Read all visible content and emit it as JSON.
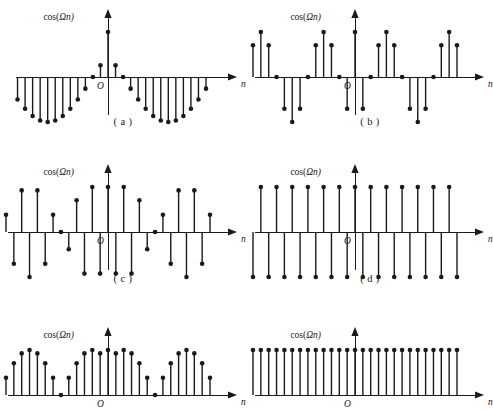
{
  "figure": {
    "kind": "stem-plot-grid",
    "background_color": "#ffffff",
    "ink_color": "#1a1a1a",
    "rows": 3,
    "cols": 2
  },
  "labels": {
    "y_axis_prefix": "cos(",
    "y_axis_symbol": "Ω",
    "y_axis_suffix": "n)",
    "x_axis": "n",
    "origin": "O"
  },
  "captions": {
    "a": "( a )",
    "b": "( b )",
    "c": "( c )",
    "d": "( d )",
    "e": "( e )",
    "f": "( f )"
  },
  "chart_data": [
    {
      "id": "a",
      "type": "scatter",
      "title": "",
      "ylabel": "cos(Ωn)",
      "xlabel": "n",
      "grid": false,
      "legend": null,
      "omega_over_pi": 0.0833,
      "n_min": -13,
      "n_max": 13,
      "ylim": [
        -1,
        1
      ],
      "x": [
        -13,
        -12,
        -11,
        -10,
        -9,
        -8,
        -7,
        -6,
        -5,
        -4,
        -3,
        -2,
        -1,
        0,
        1,
        2,
        3,
        4,
        5,
        6,
        7,
        8,
        9,
        10,
        11,
        12,
        13
      ],
      "values": [
        -0.259,
        -0.5,
        -0.707,
        -0.866,
        -0.966,
        -1.0,
        -0.966,
        -0.866,
        -0.707,
        -0.5,
        -0.259,
        0.0,
        0.259,
        1.0,
        0.259,
        0.0,
        -0.259,
        -0.5,
        -0.707,
        -0.866,
        -0.966,
        -1.0,
        -0.966,
        -0.866,
        -0.707,
        -0.5,
        -0.259
      ]
    },
    {
      "id": "b",
      "type": "scatter",
      "title": "",
      "ylabel": "cos(Ωn)",
      "xlabel": "n",
      "grid": false,
      "legend": null,
      "omega_over_pi": 0.25,
      "n_min": -13,
      "n_max": 13,
      "ylim": [
        -1,
        1
      ],
      "x": [
        -13,
        -12,
        -11,
        -10,
        -9,
        -8,
        -7,
        -6,
        -5,
        -4,
        -3,
        -2,
        -1,
        0,
        1,
        2,
        3,
        4,
        5,
        6,
        7,
        8,
        9,
        10,
        11,
        12,
        13
      ],
      "values": [
        0.707,
        1.0,
        0.707,
        0.0,
        -0.707,
        -1.0,
        -0.707,
        0.0,
        0.707,
        1.0,
        0.707,
        0.0,
        -0.707,
        1.0,
        -0.707,
        0.0,
        0.707,
        1.0,
        0.707,
        0.0,
        -0.707,
        -1.0,
        -0.707,
        0.0,
        0.707,
        1.0,
        0.707
      ]
    },
    {
      "id": "c",
      "type": "scatter",
      "title": "",
      "ylabel": "cos(Ωn)",
      "xlabel": "n",
      "grid": false,
      "legend": null,
      "omega_over_pi": 0.875,
      "n_min": -13,
      "n_max": 13,
      "ylim": [
        -1,
        1
      ],
      "x": [
        -13,
        -12,
        -11,
        -10,
        -9,
        -8,
        -7,
        -6,
        -5,
        -4,
        -3,
        -2,
        -1,
        0,
        1,
        2,
        3,
        4,
        5,
        6,
        7,
        8,
        9,
        10,
        11,
        12,
        13
      ],
      "values": [
        0.383,
        -0.707,
        0.924,
        -1.0,
        0.924,
        -0.707,
        0.383,
        0.0,
        -0.383,
        0.707,
        -0.924,
        1.0,
        -0.924,
        1.0,
        -0.924,
        1.0,
        -0.924,
        0.707,
        -0.383,
        0.0,
        0.383,
        -0.707,
        0.924,
        -1.0,
        0.924,
        -0.707,
        0.383
      ]
    },
    {
      "id": "d",
      "type": "scatter",
      "title": "",
      "ylabel": "cos(Ωn)",
      "xlabel": "n",
      "grid": false,
      "legend": null,
      "omega_over_pi": 1.0,
      "n_min": -13,
      "n_max": 13,
      "ylim": [
        -1,
        1
      ],
      "x": [
        -13,
        -12,
        -11,
        -10,
        -9,
        -8,
        -7,
        -6,
        -5,
        -4,
        -3,
        -2,
        -1,
        0,
        1,
        2,
        3,
        4,
        5,
        6,
        7,
        8,
        9,
        10,
        11,
        12,
        13
      ],
      "values": [
        -1,
        1,
        -1,
        1,
        -1,
        1,
        -1,
        1,
        -1,
        1,
        -1,
        1,
        -1,
        1,
        -1,
        1,
        -1,
        1,
        -1,
        1,
        -1,
        1,
        -1,
        1,
        -1,
        1,
        -1
      ]
    },
    {
      "id": "e",
      "type": "scatter",
      "title": "",
      "ylabel": "cos(Ωn)",
      "xlabel": "n",
      "grid": false,
      "legend": null,
      "omega_over_pi": 1.875,
      "n_min": -13,
      "n_max": 13,
      "ylim": [
        -1,
        1
      ],
      "x": [
        -13,
        -12,
        -11,
        -10,
        -9,
        -8,
        -7,
        -6,
        -5,
        -4,
        -3,
        -2,
        -1,
        0,
        1,
        2,
        3,
        4,
        5,
        6,
        7,
        8,
        9,
        10,
        11,
        12,
        13
      ],
      "values": [
        0.383,
        0.707,
        0.924,
        1.0,
        0.924,
        0.707,
        0.383,
        0.0,
        0.383,
        0.707,
        0.924,
        1.0,
        0.924,
        1.0,
        0.924,
        1.0,
        0.924,
        0.707,
        0.383,
        0.0,
        0.383,
        0.707,
        0.924,
        1.0,
        0.924,
        0.707,
        0.383
      ]
    },
    {
      "id": "f",
      "type": "scatter",
      "title": "",
      "ylabel": "cos(Ωn)",
      "xlabel": "n",
      "grid": false,
      "legend": null,
      "omega_over_pi": 2.0,
      "n_min": -13,
      "n_max": 13,
      "ylim": [
        -1,
        1
      ],
      "x": [
        -13,
        -12,
        -11,
        -10,
        -9,
        -8,
        -7,
        -6,
        -5,
        -4,
        -3,
        -2,
        -1,
        0,
        1,
        2,
        3,
        4,
        5,
        6,
        7,
        8,
        9,
        10,
        11,
        12,
        13
      ],
      "values": [
        1,
        1,
        1,
        1,
        1,
        1,
        1,
        1,
        1,
        1,
        1,
        1,
        1,
        1,
        1,
        1,
        1,
        1,
        1,
        1,
        1,
        1,
        1,
        1,
        1,
        1,
        1
      ]
    }
  ],
  "panel_layout": [
    {
      "id": "a",
      "left": 0,
      "top": 0,
      "axis_y": 77,
      "origin_x": 108,
      "x_start": 26,
      "x_end": 222,
      "amp": 45,
      "caption_top": 116,
      "ylabel_x": 74,
      "ylabel_y": 20,
      "axis_top": 18,
      "axis_bottom": 115,
      "clip_bottom": false
    },
    {
      "id": "b",
      "left": 247,
      "top": 0,
      "axis_y": 77,
      "origin_x": 108,
      "x_start": 18,
      "x_end": 222,
      "amp": 45,
      "caption_top": 116,
      "ylabel_x": 74,
      "ylabel_y": 20,
      "axis_top": 18,
      "axis_bottom": 115,
      "clip_bottom": false
    },
    {
      "id": "c",
      "left": 0,
      "top": 155,
      "axis_y": 77,
      "origin_x": 108,
      "x_start": 18,
      "x_end": 222,
      "amp": 45,
      "caption_top": 118,
      "ylabel_x": 74,
      "ylabel_y": 20,
      "axis_top": 18,
      "axis_bottom": 115,
      "clip_bottom": false
    },
    {
      "id": "d",
      "left": 247,
      "top": 155,
      "axis_y": 77,
      "origin_x": 108,
      "x_start": 18,
      "x_end": 222,
      "amp": 45,
      "caption_top": 118,
      "ylabel_x": 74,
      "ylabel_y": 20,
      "axis_top": 18,
      "axis_bottom": 115,
      "clip_bottom": false
    },
    {
      "id": "e",
      "left": 0,
      "top": 318,
      "axis_y": 77,
      "origin_x": 108,
      "x_start": 18,
      "x_end": 222,
      "amp": 45,
      "caption_top": 118,
      "ylabel_x": 74,
      "ylabel_y": 20,
      "axis_top": 18,
      "axis_bottom": 115,
      "clip_bottom": true
    },
    {
      "id": "f",
      "left": 247,
      "top": 318,
      "axis_y": 77,
      "origin_x": 108,
      "x_start": 18,
      "x_end": 222,
      "amp": 45,
      "caption_top": 118,
      "ylabel_x": 74,
      "ylabel_y": 20,
      "axis_top": 18,
      "axis_bottom": 115,
      "clip_bottom": true
    }
  ]
}
